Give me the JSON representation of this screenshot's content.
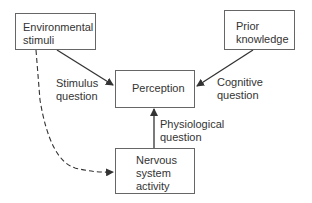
{
  "diagram": {
    "nodes": {
      "environmental_stimuli": {
        "line1": "Environmental",
        "line2": "stimuli"
      },
      "prior_knowledge": {
        "line1": "Prior",
        "line2": "knowledge"
      },
      "perception": {
        "line1": "Perception"
      },
      "nervous_system_activity": {
        "line1": "Nervous",
        "line2": "system",
        "line3": "activity"
      }
    },
    "edges": {
      "stimulus_question": {
        "line1": "Stimulus",
        "line2": "question",
        "from": "Environmental stimuli",
        "to": "Perception",
        "style": "solid"
      },
      "cognitive_question": {
        "line1": "Cognitive",
        "line2": "question",
        "from": "Prior knowledge",
        "to": "Perception",
        "style": "solid"
      },
      "physiological_question": {
        "line1": "Physiological",
        "line2": "question",
        "from": "Nervous system activity",
        "to": "Perception",
        "style": "solid"
      },
      "stimuli_to_nervous": {
        "from": "Environmental stimuli",
        "to": "Nervous system activity",
        "style": "dashed"
      }
    },
    "colors": {
      "stroke": "#333333",
      "box_border": "#666666",
      "text": "#333333"
    }
  }
}
